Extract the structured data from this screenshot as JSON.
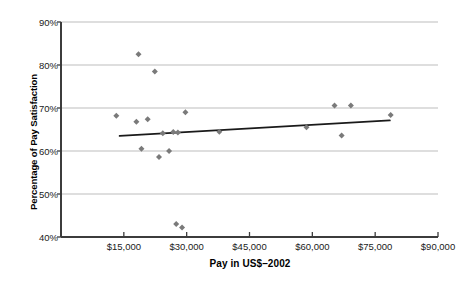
{
  "chart_data": {
    "type": "scatter",
    "title": "",
    "xlabel": "Pay in US$–2002",
    "ylabel": "Percentage of Pay Satisfaction",
    "xlim": [
      0,
      90000
    ],
    "ylim": [
      40,
      90
    ],
    "grid": "horizontal",
    "legend": "none",
    "marker": "diamond",
    "marker_color": "#7a7a7a",
    "trendline_color": "#1a1a1a",
    "axis_color": "#3c3c3c",
    "grid_color": "#b5b5b5",
    "xticks": [
      {
        "value": 0,
        "label": ""
      },
      {
        "value": 15000,
        "label": "$15,000"
      },
      {
        "value": 30000,
        "label": "$30,000"
      },
      {
        "value": 45000,
        "label": "$45,000"
      },
      {
        "value": 60000,
        "label": "$60,000"
      },
      {
        "value": 75000,
        "label": "$75,000"
      },
      {
        "value": 90000,
        "label": "$90,000"
      }
    ],
    "yticks": [
      {
        "value": 40,
        "label": "40%"
      },
      {
        "value": 50,
        "label": "50%"
      },
      {
        "value": 60,
        "label": "60%"
      },
      {
        "value": 70,
        "label": "70%"
      },
      {
        "value": 80,
        "label": "80%"
      },
      {
        "value": 90,
        "label": "90%"
      }
    ],
    "series": [
      {
        "name": "Pay satisfaction vs pay",
        "points": [
          {
            "x": 13200,
            "y": 68.2
          },
          {
            "x": 18500,
            "y": 82.5
          },
          {
            "x": 22400,
            "y": 78.5
          },
          {
            "x": 18000,
            "y": 66.8
          },
          {
            "x": 20700,
            "y": 67.4
          },
          {
            "x": 19200,
            "y": 60.5
          },
          {
            "x": 24300,
            "y": 64.1
          },
          {
            "x": 26800,
            "y": 64.4
          },
          {
            "x": 27900,
            "y": 64.3
          },
          {
            "x": 29700,
            "y": 69.0
          },
          {
            "x": 25800,
            "y": 60.0
          },
          {
            "x": 23400,
            "y": 58.6
          },
          {
            "x": 27500,
            "y": 43.0
          },
          {
            "x": 28900,
            "y": 42.2
          },
          {
            "x": 37800,
            "y": 64.5
          },
          {
            "x": 58600,
            "y": 65.5
          },
          {
            "x": 65300,
            "y": 70.6
          },
          {
            "x": 69200,
            "y": 70.6
          },
          {
            "x": 67000,
            "y": 63.6
          },
          {
            "x": 78700,
            "y": 68.4
          }
        ]
      }
    ],
    "trendline": {
      "name": "linear-fit",
      "x0": 14000,
      "y0": 63.5,
      "x1": 78500,
      "y1": 67.1
    }
  }
}
